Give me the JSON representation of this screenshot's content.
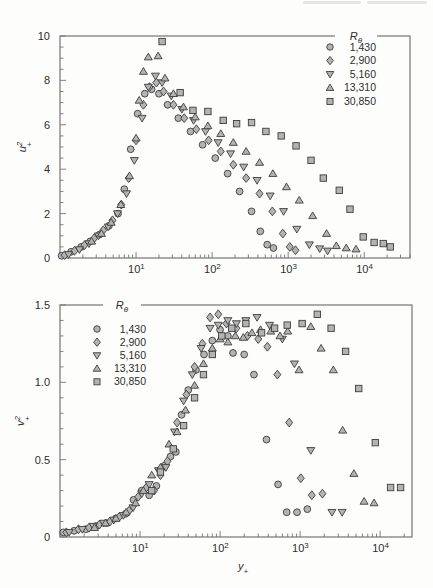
{
  "page": {
    "background": "#fdfdfc"
  },
  "colors": {
    "marker_fill": "#b3b3b3",
    "marker_stroke": "#3d3d3d",
    "axis": "#757575",
    "text": "#2e2e2e"
  },
  "chart_data": [
    {
      "type": "scatter",
      "xscale": "log",
      "ylabel": {
        "base": "u",
        "sup": "2",
        "sub": "+"
      },
      "xlabel": null,
      "xlim": [
        1,
        40000
      ],
      "ylim": [
        0,
        10
      ],
      "ytick_values": [
        0,
        2,
        4,
        6,
        8,
        10
      ],
      "ytick_labels": [
        "0",
        "2",
        "4",
        "6",
        "8",
        "10"
      ],
      "y_minor_step": 0.5,
      "xtick_exponents": [
        1,
        2,
        3,
        4
      ],
      "grid": false,
      "legend": {
        "title": {
          "base": "R",
          "sub": "θ"
        },
        "position": "top-right"
      },
      "series": [
        {
          "name": "1,430",
          "marker": "circle",
          "points": [
            [
              1.05,
              0.1
            ],
            [
              1.4,
              0.28
            ],
            [
              1.9,
              0.5
            ],
            [
              2.5,
              0.75
            ],
            [
              3.3,
              1.05
            ],
            [
              4.4,
              1.45
            ],
            [
              5.8,
              2.0
            ],
            [
              7.0,
              3.1
            ],
            [
              8.5,
              4.9
            ],
            [
              10.5,
              6.5
            ],
            [
              13,
              7.4
            ],
            [
              16,
              7.6
            ],
            [
              20,
              7.4
            ],
            [
              26,
              6.9
            ],
            [
              36,
              6.3
            ],
            [
              52,
              5.7
            ],
            [
              75,
              5.1
            ],
            [
              110,
              4.5
            ],
            [
              160,
              3.8
            ],
            [
              230,
              3.0
            ],
            [
              330,
              2.1
            ],
            [
              430,
              1.2
            ],
            [
              530,
              0.6
            ],
            [
              640,
              0.45
            ]
          ]
        },
        {
          "name": "2,900",
          "marker": "diamond",
          "points": [
            [
              1.15,
              0.13
            ],
            [
              1.55,
              0.32
            ],
            [
              2.1,
              0.58
            ],
            [
              2.8,
              0.88
            ],
            [
              3.7,
              1.25
            ],
            [
              4.9,
              1.7
            ],
            [
              6.4,
              2.4
            ],
            [
              8.0,
              3.6
            ],
            [
              10,
              5.3
            ],
            [
              12.5,
              6.9
            ],
            [
              15,
              7.7
            ],
            [
              18.5,
              7.9
            ],
            [
              23,
              7.5
            ],
            [
              31,
              6.9
            ],
            [
              43,
              6.3
            ],
            [
              62,
              5.8
            ],
            [
              90,
              5.3
            ],
            [
              130,
              4.8
            ],
            [
              190,
              4.2
            ],
            [
              280,
              3.6
            ],
            [
              420,
              2.9
            ],
            [
              620,
              2.1
            ],
            [
              850,
              1.1
            ],
            [
              1050,
              0.5
            ],
            [
              1250,
              0.35
            ]
          ]
        },
        {
          "name": "5,160",
          "marker": "triangle-down",
          "points": [
            [
              1.3,
              0.16
            ],
            [
              1.8,
              0.38
            ],
            [
              2.4,
              0.65
            ],
            [
              3.2,
              1.0
            ],
            [
              4.3,
              1.4
            ],
            [
              5.7,
              2.0
            ],
            [
              7.5,
              2.9
            ],
            [
              9.5,
              4.4
            ],
            [
              12,
              6.3
            ],
            [
              14.5,
              7.7
            ],
            [
              18,
              8.2
            ],
            [
              22,
              7.9
            ],
            [
              29,
              7.3
            ],
            [
              40,
              6.7
            ],
            [
              57,
              6.2
            ],
            [
              82,
              5.7
            ],
            [
              120,
              5.2
            ],
            [
              175,
              4.7
            ],
            [
              260,
              4.1
            ],
            [
              390,
              3.5
            ],
            [
              580,
              2.8
            ],
            [
              870,
              2.1
            ],
            [
              1300,
              1.3
            ],
            [
              1900,
              0.6
            ],
            [
              2600,
              0.42
            ],
            [
              3300,
              0.32
            ]
          ]
        },
        {
          "name": "13,310",
          "marker": "triangle-up",
          "points": [
            [
              2.6,
              0.75
            ],
            [
              3.5,
              1.1
            ],
            [
              4.7,
              1.6
            ],
            [
              6.3,
              2.4
            ],
            [
              8.2,
              3.7
            ],
            [
              10,
              5.4
            ],
            [
              11,
              7.1
            ],
            [
              12.5,
              8.4
            ],
            [
              14.5,
              9.05
            ],
            [
              19.5,
              9.1
            ],
            [
              24,
              8.1
            ],
            [
              31,
              7.4
            ],
            [
              42,
              6.8
            ],
            [
              60,
              6.35
            ],
            [
              88,
              5.95
            ],
            [
              130,
              5.6
            ],
            [
              190,
              5.2
            ],
            [
              280,
              4.8
            ],
            [
              420,
              4.3
            ],
            [
              630,
              3.8
            ],
            [
              950,
              3.2
            ],
            [
              1400,
              2.6
            ],
            [
              2100,
              1.9
            ],
            [
              3200,
              1.1
            ],
            [
              4300,
              0.55
            ],
            [
              5800,
              0.45
            ],
            [
              7800,
              0.4
            ]
          ]
        },
        {
          "name": "30,850",
          "marker": "square",
          "points": [
            [
              22,
              9.75
            ],
            [
              38,
              7.45
            ],
            [
              56,
              6.65
            ],
            [
              88,
              6.6
            ],
            [
              140,
              6.2
            ],
            [
              210,
              6.05
            ],
            [
              330,
              6.1
            ],
            [
              510,
              5.7
            ],
            [
              810,
              5.5
            ],
            [
              1270,
              5.05
            ],
            [
              2000,
              4.4
            ],
            [
              2900,
              3.6
            ],
            [
              4700,
              3.05
            ],
            [
              6500,
              2.2
            ],
            [
              9700,
              0.95
            ],
            [
              13500,
              0.7
            ],
            [
              17800,
              0.65
            ],
            [
              22000,
              0.5
            ]
          ]
        }
      ]
    },
    {
      "type": "scatter",
      "xscale": "log",
      "ylabel": {
        "base": "v",
        "sup": "2",
        "sub": "+"
      },
      "xlabel": {
        "base": "y",
        "sub": "+"
      },
      "xlim": [
        1,
        25000
      ],
      "ylim": [
        0,
        1.5
      ],
      "ytick_values": [
        0,
        0.5,
        1.0,
        1.5
      ],
      "ytick_labels": [
        "0",
        "0.5",
        "1.0",
        "1.5"
      ],
      "y_minor_step": 0.1,
      "xtick_exponents": [
        1,
        2,
        3,
        4
      ],
      "grid": false,
      "legend": {
        "title": {
          "base": "R",
          "sub": "θ"
        },
        "position": "top-left"
      },
      "series": [
        {
          "name": "1,430",
          "marker": "circle",
          "points": [
            [
              1.1,
              0.03
            ],
            [
              1.5,
              0.04
            ],
            [
              2.1,
              0.05
            ],
            [
              2.8,
              0.07
            ],
            [
              3.8,
              0.09
            ],
            [
              5.0,
              0.12
            ],
            [
              6.6,
              0.15
            ],
            [
              8.3,
              0.24
            ],
            [
              10.5,
              0.3
            ],
            [
              13,
              0.27
            ],
            [
              16,
              0.33
            ],
            [
              20,
              0.46
            ],
            [
              24,
              0.52
            ],
            [
              28,
              0.55
            ],
            [
              33,
              0.79
            ],
            [
              40,
              0.95
            ],
            [
              50,
              1.08
            ],
            [
              63,
              1.18
            ],
            [
              80,
              1.27
            ],
            [
              100,
              1.34
            ],
            [
              125,
              1.3
            ],
            [
              145,
              1.19
            ],
            [
              200,
              1.18
            ],
            [
              265,
              1.05
            ],
            [
              380,
              0.63
            ],
            [
              530,
              0.34
            ],
            [
              680,
              0.16
            ],
            [
              915,
              0.16
            ],
            [
              1230,
              0.18
            ]
          ]
        },
        {
          "name": "2,900",
          "marker": "diamond",
          "points": [
            [
              1.2,
              0.03
            ],
            [
              1.7,
              0.05
            ],
            [
              2.3,
              0.06
            ],
            [
              3.1,
              0.08
            ],
            [
              4.2,
              0.1
            ],
            [
              5.5,
              0.13
            ],
            [
              7.3,
              0.17
            ],
            [
              9.5,
              0.26
            ],
            [
              12,
              0.32
            ],
            [
              15,
              0.3
            ],
            [
              18,
              0.4
            ],
            [
              22,
              0.49
            ],
            [
              29,
              0.74
            ],
            [
              38,
              0.92
            ],
            [
              48,
              1.1
            ],
            [
              60,
              1.25
            ],
            [
              75,
              1.42
            ],
            [
              95,
              1.44
            ],
            [
              120,
              1.38
            ],
            [
              160,
              1.35
            ],
            [
              220,
              1.3
            ],
            [
              300,
              1.28
            ],
            [
              390,
              1.23
            ],
            [
              520,
              1.05
            ],
            [
              730,
              0.74
            ],
            [
              1020,
              0.38
            ],
            [
              1400,
              0.27
            ],
            [
              1900,
              0.28
            ]
          ]
        },
        {
          "name": "5,160",
          "marker": "triangle-down",
          "points": [
            [
              1.3,
              0.03
            ],
            [
              1.9,
              0.05
            ],
            [
              2.6,
              0.07
            ],
            [
              3.5,
              0.09
            ],
            [
              4.7,
              0.11
            ],
            [
              6.2,
              0.14
            ],
            [
              8.2,
              0.19
            ],
            [
              10.5,
              0.28
            ],
            [
              13,
              0.34
            ],
            [
              17,
              0.43
            ],
            [
              21,
              0.45
            ],
            [
              27,
              0.68
            ],
            [
              35,
              0.88
            ],
            [
              45,
              1.05
            ],
            [
              58,
              1.22
            ],
            [
              75,
              1.35
            ],
            [
              95,
              1.37
            ],
            [
              125,
              1.4
            ],
            [
              160,
              1.38
            ],
            [
              210,
              1.4
            ],
            [
              290,
              1.42
            ],
            [
              415,
              1.37
            ],
            [
              600,
              1.28
            ],
            [
              850,
              1.12
            ],
            [
              1360,
              0.56
            ],
            [
              2500,
              0.16
            ],
            [
              3350,
              0.16
            ]
          ]
        },
        {
          "name": "13,310",
          "marker": "triangle-up",
          "points": [
            [
              2.7,
              0.06
            ],
            [
              3.7,
              0.09
            ],
            [
              5.0,
              0.12
            ],
            [
              6.7,
              0.16
            ],
            [
              8.8,
              0.22
            ],
            [
              11,
              0.3
            ],
            [
              14,
              0.4
            ],
            [
              18,
              0.45
            ],
            [
              23,
              0.6
            ],
            [
              29,
              0.68
            ],
            [
              37,
              0.82
            ],
            [
              48,
              0.98
            ],
            [
              62,
              1.12
            ],
            [
              80,
              1.22
            ],
            [
              100,
              1.28
            ],
            [
              125,
              1.26
            ],
            [
              155,
              1.3
            ],
            [
              195,
              1.29
            ],
            [
              250,
              1.32
            ],
            [
              320,
              1.34
            ],
            [
              430,
              1.33
            ],
            [
              560,
              1.3
            ],
            [
              700,
              1.33
            ],
            [
              970,
              1.08
            ],
            [
              1360,
              1.36
            ],
            [
              1830,
              1.22
            ],
            [
              2600,
              1.08
            ],
            [
              3400,
              0.69
            ],
            [
              4700,
              0.41
            ],
            [
              6300,
              0.23
            ],
            [
              8400,
              0.22
            ]
          ]
        },
        {
          "name": "30,850",
          "marker": "square",
          "points": [
            [
              14,
              0.3
            ],
            [
              18,
              0.42
            ],
            [
              26,
              0.57
            ],
            [
              35,
              0.72
            ],
            [
              48,
              0.9
            ],
            [
              62,
              1.05
            ],
            [
              80,
              1.18
            ],
            [
              105,
              1.3
            ],
            [
              140,
              1.35
            ],
            [
              210,
              1.38
            ],
            [
              330,
              1.32
            ],
            [
              480,
              1.35
            ],
            [
              690,
              1.37
            ],
            [
              1060,
              1.38
            ],
            [
              1640,
              1.44
            ],
            [
              2440,
              1.35
            ],
            [
              3700,
              1.2
            ],
            [
              5400,
              0.96
            ],
            [
              8700,
              0.61
            ],
            [
              13500,
              0.32
            ],
            [
              18000,
              0.32
            ]
          ]
        }
      ]
    }
  ]
}
